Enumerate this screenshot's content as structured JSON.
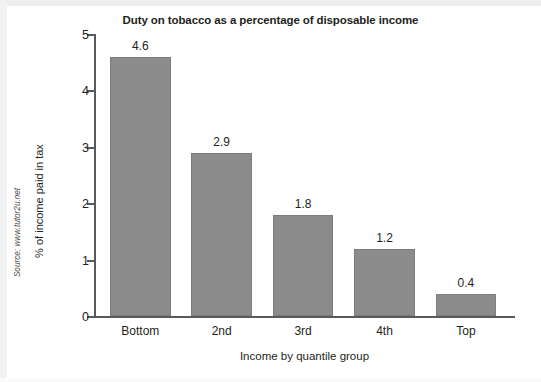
{
  "chart_data": {
    "type": "bar",
    "title": "Duty on tobacco as a percentage of disposable income",
    "xlabel": "Income by quantile group",
    "ylabel": "% of income paid in tax",
    "categories": [
      "Bottom",
      "2nd",
      "3rd",
      "4th",
      "Top"
    ],
    "values": [
      4.6,
      2.9,
      1.8,
      1.2,
      0.4
    ],
    "value_labels": [
      "4.6",
      "2.9",
      "1.8",
      "1.2",
      "0.4"
    ],
    "ylim": [
      0,
      5
    ],
    "yticks": [
      0,
      1,
      2,
      3,
      4,
      5
    ],
    "ytick_labels": [
      "0",
      "1",
      "2",
      "3",
      "4",
      "5"
    ],
    "grid": false,
    "legend": null,
    "bar_color": "#8b8b8b",
    "axis_color": "#58595b",
    "text_color": "#231f20"
  },
  "source_note": "Source: www.tutor2u.net"
}
